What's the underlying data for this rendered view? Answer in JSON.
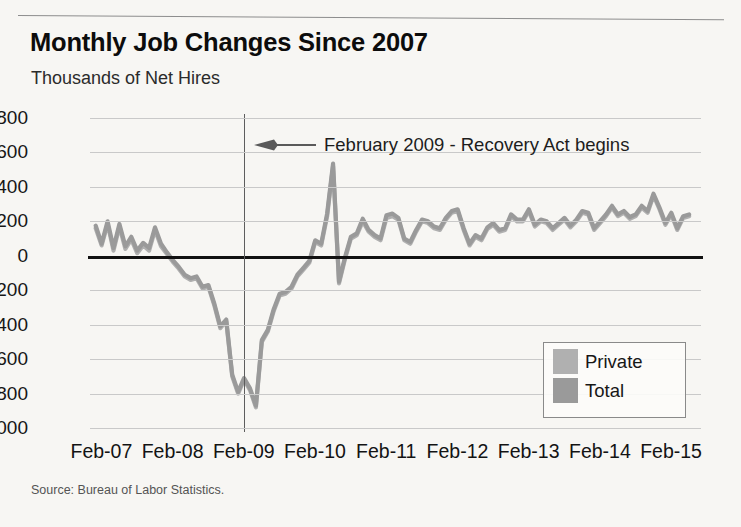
{
  "chart_data": {
    "type": "line",
    "title": "Monthly Job Changes Since 2007",
    "subtitle": "Thousands of Net Hires",
    "xlabel": "",
    "ylabel": "Thousands of Net Hires",
    "source": "Source: Bureau of Labor Statistics.",
    "grid": true,
    "legend_position": "inside-bottom-right",
    "ylim": [
      -1000,
      800
    ],
    "yticks": [
      "800",
      "600",
      "400",
      "200",
      "0",
      "-200",
      "-400",
      "-600",
      "-800",
      "-1000"
    ],
    "ytick_values": [
      800,
      600,
      400,
      200,
      0,
      -200,
      -400,
      -600,
      -800,
      -1000
    ],
    "xticks": [
      "Feb-07",
      "Feb-08",
      "Feb-09",
      "Feb-10",
      "Feb-11",
      "Feb-12",
      "Feb-13",
      "Feb-14",
      "Feb-15"
    ],
    "xtick_values": [
      2007.08,
      2008.08,
      2009.08,
      2010.08,
      2011.08,
      2012.08,
      2013.08,
      2014.08,
      2015.08
    ],
    "xlim": [
      2006.92,
      2015.5
    ],
    "annotations": [
      {
        "text": "February 2009 - Recovery Act begins",
        "x": 2009.08,
        "marker": "vertical-line",
        "arrow": "left"
      }
    ],
    "colors": {
      "private": "#b0b0b0",
      "total": "#9a9a9a",
      "zero_line": "#111111",
      "gridline": "#c9c9c9",
      "event_line": "#5d5d5d",
      "background": "#f7f6f3"
    },
    "series": [
      {
        "name": "Private",
        "color": "#b0b0b0",
        "x": [
          2007.0,
          2007.083,
          2007.167,
          2007.25,
          2007.333,
          2007.417,
          2007.5,
          2007.583,
          2007.667,
          2007.75,
          2007.833,
          2007.917,
          2008.0,
          2008.083,
          2008.167,
          2008.25,
          2008.333,
          2008.417,
          2008.5,
          2008.583,
          2008.667,
          2008.75,
          2008.833,
          2008.917,
          2009.0,
          2009.083,
          2009.167,
          2009.25,
          2009.333,
          2009.417,
          2009.5,
          2009.583,
          2009.667,
          2009.75,
          2009.833,
          2009.917,
          2010.0,
          2010.083,
          2010.167,
          2010.25,
          2010.333,
          2010.417,
          2010.5,
          2010.583,
          2010.667,
          2010.75,
          2010.833,
          2010.917,
          2011.0,
          2011.083,
          2011.167,
          2011.25,
          2011.333,
          2011.417,
          2011.5,
          2011.583,
          2011.667,
          2011.75,
          2011.833,
          2011.917,
          2012.0,
          2012.083,
          2012.167,
          2012.25,
          2012.333,
          2012.417,
          2012.5,
          2012.583,
          2012.667,
          2012.75,
          2012.833,
          2012.917,
          2013.0,
          2013.083,
          2013.167,
          2013.25,
          2013.333,
          2013.417,
          2013.5,
          2013.583,
          2013.667,
          2013.75,
          2013.833,
          2013.917,
          2014.0,
          2014.083,
          2014.167,
          2014.25,
          2014.333,
          2014.417,
          2014.5,
          2014.583,
          2014.667,
          2014.75,
          2014.833,
          2014.917,
          2015.0,
          2015.083,
          2015.167,
          2015.25,
          2015.333
        ],
        "values": [
          160,
          60,
          185,
          30,
          170,
          40,
          95,
          15,
          60,
          30,
          150,
          55,
          10,
          -35,
          -75,
          -120,
          -140,
          -130,
          -190,
          -180,
          -290,
          -420,
          -380,
          -700,
          -800,
          -720,
          -780,
          -880,
          -500,
          -440,
          -320,
          -230,
          -220,
          -190,
          -120,
          -80,
          -40,
          80,
          60,
          230,
          520,
          -160,
          -20,
          100,
          120,
          200,
          140,
          110,
          90,
          220,
          230,
          210,
          90,
          70,
          140,
          200,
          190,
          160,
          150,
          210,
          250,
          260,
          150,
          60,
          110,
          90,
          155,
          180,
          140,
          150,
          230,
          200,
          200,
          260,
          170,
          200,
          190,
          150,
          180,
          210,
          165,
          200,
          250,
          240,
          150,
          190,
          230,
          280,
          230,
          250,
          215,
          230,
          280,
          250,
          350,
          270,
          180,
          240,
          150,
          220,
          230
        ]
      },
      {
        "name": "Total",
        "color": "#9a9a9a",
        "x": [
          2007.0,
          2007.083,
          2007.167,
          2007.25,
          2007.333,
          2007.417,
          2007.5,
          2007.583,
          2007.667,
          2007.75,
          2007.833,
          2007.917,
          2008.0,
          2008.083,
          2008.167,
          2008.25,
          2008.333,
          2008.417,
          2008.5,
          2008.583,
          2008.667,
          2008.75,
          2008.833,
          2008.917,
          2009.0,
          2009.083,
          2009.167,
          2009.25,
          2009.333,
          2009.417,
          2009.5,
          2009.583,
          2009.667,
          2009.75,
          2009.833,
          2009.917,
          2010.0,
          2010.083,
          2010.167,
          2010.25,
          2010.333,
          2010.417,
          2010.5,
          2010.583,
          2010.667,
          2010.75,
          2010.833,
          2010.917,
          2011.0,
          2011.083,
          2011.167,
          2011.25,
          2011.333,
          2011.417,
          2011.5,
          2011.583,
          2011.667,
          2011.75,
          2011.833,
          2011.917,
          2012.0,
          2012.083,
          2012.167,
          2012.25,
          2012.333,
          2012.417,
          2012.5,
          2012.583,
          2012.667,
          2012.75,
          2012.833,
          2012.917,
          2013.0,
          2013.083,
          2013.167,
          2013.25,
          2013.333,
          2013.417,
          2013.5,
          2013.583,
          2013.667,
          2013.75,
          2013.833,
          2013.917,
          2014.0,
          2014.083,
          2014.167,
          2014.25,
          2014.333,
          2014.417,
          2014.5,
          2014.583,
          2014.667,
          2014.75,
          2014.833,
          2014.917,
          2015.0,
          2015.083,
          2015.167,
          2015.25,
          2015.333
        ],
        "values": [
          175,
          70,
          200,
          45,
          185,
          55,
          110,
          30,
          75,
          45,
          165,
          70,
          20,
          -25,
          -65,
          -110,
          -130,
          -120,
          -180,
          -170,
          -280,
          -410,
          -370,
          -690,
          -790,
          -710,
          -770,
          -870,
          -490,
          -430,
          -310,
          -220,
          -210,
          -180,
          -110,
          -70,
          -30,
          90,
          70,
          245,
          535,
          -150,
          -10,
          110,
          130,
          215,
          150,
          120,
          100,
          235,
          245,
          220,
          100,
          80,
          150,
          210,
          200,
          170,
          160,
          220,
          260,
          270,
          160,
          70,
          120,
          100,
          165,
          190,
          150,
          160,
          240,
          210,
          210,
          270,
          180,
          210,
          200,
          160,
          190,
          220,
          175,
          210,
          260,
          250,
          160,
          200,
          240,
          290,
          240,
          260,
          225,
          240,
          290,
          260,
          360,
          280,
          190,
          250,
          160,
          230,
          240
        ]
      }
    ]
  },
  "legend": {
    "items": [
      {
        "label": "Private",
        "color": "#b0b0b0"
      },
      {
        "label": "Total",
        "color": "#9a9a9a"
      }
    ]
  },
  "annotation": {
    "label": "February 2009 - Recovery Act begins"
  }
}
